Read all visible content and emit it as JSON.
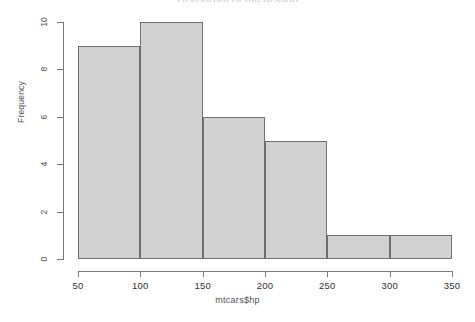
{
  "chart_data": {
    "type": "bar",
    "title": "Histogram of mtcars$hp",
    "xlabel": "mtcars$hp",
    "ylabel": "Frequency",
    "categories": [
      "50-100",
      "100-150",
      "150-200",
      "200-250",
      "250-300",
      "300-350"
    ],
    "bin_edges": [
      50,
      100,
      150,
      200,
      250,
      300,
      350
    ],
    "values": [
      9,
      10,
      6,
      5,
      1,
      1
    ],
    "xlim": [
      50,
      350
    ],
    "ylim": [
      0,
      10
    ],
    "xticks": [
      50,
      100,
      150,
      200,
      250,
      300,
      350
    ],
    "yticks": [
      0,
      2,
      4,
      6,
      8,
      10
    ],
    "grid": false,
    "legend": false,
    "bar_fill_color": "#d2d2d2",
    "bar_border_color": "#6f6f73",
    "axis_color": "#7a7a7e",
    "background_color": "#ffffff"
  }
}
